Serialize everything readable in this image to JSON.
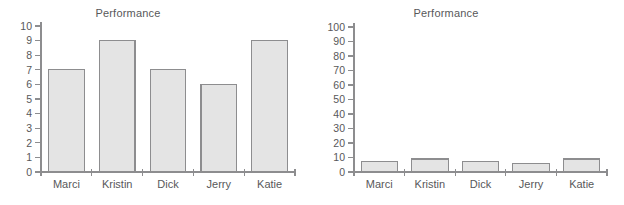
{
  "figure": {
    "background_color": "#ffffff",
    "bar_fill_color": "#e4e4e4",
    "bar_border_color": "#8d8d8f",
    "axis_color": "#8d8d8f",
    "text_color": "#58585a"
  },
  "charts": [
    {
      "id": "chart-left",
      "title": "Performance",
      "chart_data": {
        "type": "bar",
        "title": "Performance",
        "xlabel": "",
        "ylabel": "",
        "categories": [
          "Marci",
          "Kristin",
          "Dick",
          "Jerry",
          "Katie"
        ],
        "values": [
          7,
          9,
          7,
          6,
          9
        ],
        "ylim": [
          0,
          10
        ],
        "ytick_labels": [
          "10",
          "9",
          "8",
          "7",
          "6",
          "5",
          "4",
          "3",
          "2",
          "1",
          "0"
        ],
        "yticks": [
          10,
          9,
          8,
          7,
          6,
          5,
          4,
          3,
          2,
          1,
          0
        ],
        "grid": false,
        "legend": "none"
      }
    },
    {
      "id": "chart-right",
      "title": "Performance",
      "chart_data": {
        "type": "bar",
        "title": "Performance",
        "xlabel": "",
        "ylabel": "",
        "categories": [
          "Marci",
          "Kristin",
          "Dick",
          "Jerry",
          "Katie"
        ],
        "values": [
          7,
          9,
          7,
          6,
          9
        ],
        "ylim": [
          0,
          100
        ],
        "ytick_labels": [
          "100",
          "90",
          "80",
          "70",
          "60",
          "50",
          "40",
          "30",
          "20",
          "10",
          "0"
        ],
        "yticks": [
          100,
          90,
          80,
          70,
          60,
          50,
          40,
          30,
          20,
          10,
          0
        ],
        "grid": false,
        "legend": "none"
      }
    }
  ]
}
